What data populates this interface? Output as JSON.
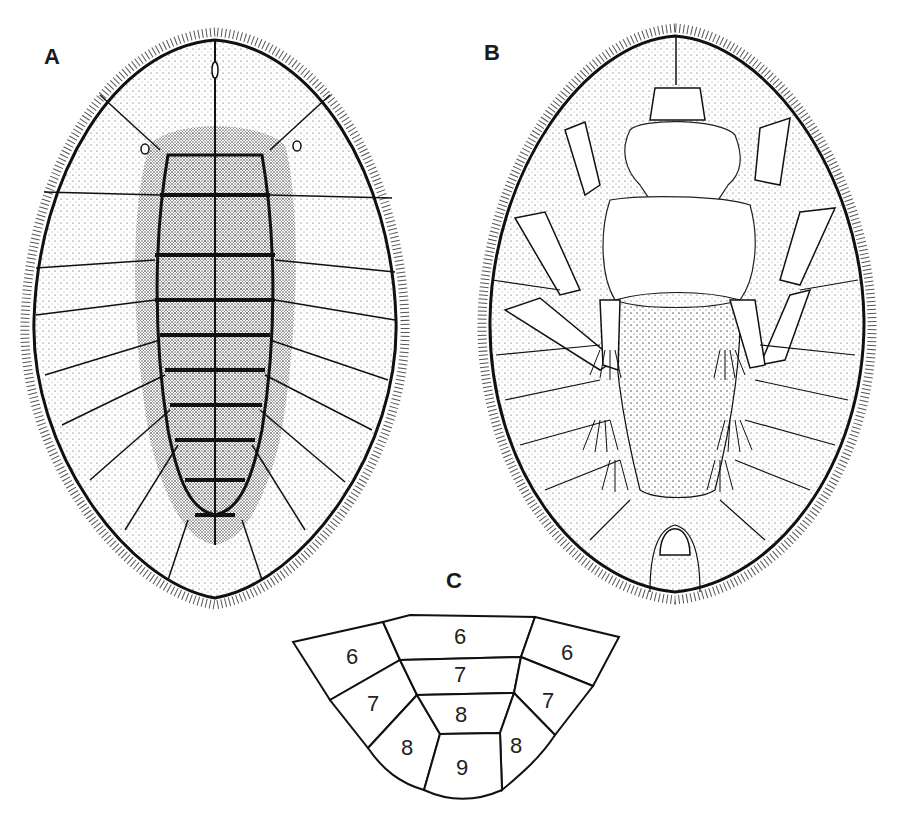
{
  "figure": {
    "panels": [
      {
        "id": "A",
        "label": "A",
        "view": "dorsal"
      },
      {
        "id": "B",
        "label": "B",
        "view": "ventral"
      },
      {
        "id": "C",
        "label": "C",
        "view": "segment-diagram"
      }
    ],
    "panel_c": {
      "segments": [
        {
          "label": "6",
          "position": "left-top"
        },
        {
          "label": "6",
          "position": "center-top"
        },
        {
          "label": "6",
          "position": "right-top"
        },
        {
          "label": "7",
          "position": "left-middle"
        },
        {
          "label": "7",
          "position": "center-middle"
        },
        {
          "label": "7",
          "position": "right-middle"
        },
        {
          "label": "8",
          "position": "left-lower"
        },
        {
          "label": "8",
          "position": "center-lower"
        },
        {
          "label": "8",
          "position": "right-lower"
        },
        {
          "label": "9",
          "position": "center-bottom"
        }
      ]
    },
    "colors": {
      "ink": "#111111",
      "background": "#ffffff"
    }
  }
}
